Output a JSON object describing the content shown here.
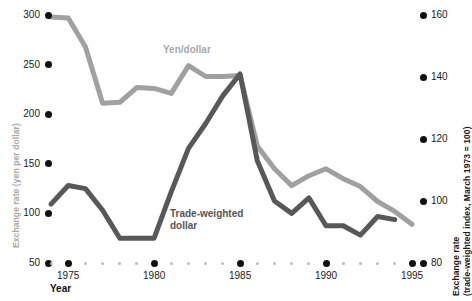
{
  "axes": {
    "left": {
      "title": "Exchange rate (yen per dollar)",
      "ticks": [
        "300",
        "250",
        "200",
        "150",
        "100",
        "50"
      ],
      "range": [
        50,
        300
      ]
    },
    "right": {
      "title_line1": "Exchange rate",
      "title_line2": "(trade-weighted index, March 1973 = 100)",
      "ticks": [
        "160",
        "140",
        "120",
        "100",
        "80"
      ],
      "range": [
        80,
        160
      ]
    },
    "x": {
      "title": "Year",
      "ticks": [
        "1975",
        "1980",
        "1985",
        "1990",
        "1995"
      ],
      "range": [
        1974,
        1995
      ]
    }
  },
  "series_labels": {
    "yen": "Yen/dollar",
    "twd_line1": "Trade-weighted",
    "twd_line2": "dollar"
  },
  "colors": {
    "yen_line": "#a0a0a0",
    "twd_line": "#585858",
    "left_axis_text": "#a8a8a8",
    "right_axis_text": "#1a1a1a",
    "tick_dot": "#111111",
    "minor_tick_dot": "#bdbdbd",
    "background": "#ffffff"
  },
  "chart_data": {
    "type": "line",
    "title": "",
    "xlabel": "Year",
    "ylabel": "Exchange rate (yen per dollar)",
    "y2label": "Exchange rate (trade-weighted index, March 1973 = 100)",
    "xlim": [
      1974,
      1995
    ],
    "ylim": [
      50,
      300
    ],
    "y2lim": [
      80,
      160
    ],
    "xticks": [
      1975,
      1980,
      1985,
      1990,
      1995
    ],
    "yticks": [
      50,
      100,
      150,
      200,
      250,
      300
    ],
    "y2ticks": [
      80,
      100,
      120,
      140,
      160
    ],
    "grid": false,
    "legend": "inline-annotations",
    "x": [
      1974,
      1975,
      1976,
      1977,
      1978,
      1979,
      1980,
      1981,
      1982,
      1983,
      1984,
      1985,
      1986,
      1987,
      1988,
      1989,
      1990,
      1991,
      1992,
      1993,
      1994,
      1995
    ],
    "series": [
      {
        "name": "Yen/dollar",
        "axis": "left",
        "color": "#a0a0a0",
        "values": [
          298,
          297,
          268,
          211,
          212,
          227,
          226,
          221,
          249,
          238,
          238,
          239,
          168,
          145,
          128,
          138,
          145,
          135,
          127,
          112,
          102,
          89
        ]
      },
      {
        "name": "Trade-weighted dollar",
        "axis": "right",
        "color": "#585858",
        "values": [
          99,
          105,
          104,
          97,
          88,
          88,
          88,
          103,
          117,
          125,
          134,
          141,
          113,
          100,
          96,
          101,
          92,
          92,
          89,
          95,
          94,
          null
        ]
      }
    ],
    "annotations": [
      {
        "text": "Yen/dollar",
        "x": 1981,
        "y": 262,
        "color": "#a9a9a9"
      },
      {
        "text": "Trade-weighted dollar",
        "x": 1981.5,
        "y": 80,
        "color": "#555555"
      }
    ]
  }
}
